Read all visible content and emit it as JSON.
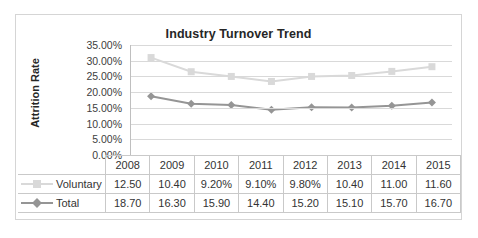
{
  "chart_data": {
    "type": "line",
    "title": "Industry Turnover Trend",
    "xlabel": "",
    "ylabel": "Attrition Rate",
    "ylim": [
      0,
      35
    ],
    "grid": true,
    "legend_position": "data-table",
    "categories": [
      "2008",
      "2009",
      "2010",
      "2011",
      "2012",
      "2013",
      "2014",
      "2015"
    ],
    "ytick_labels": [
      "0.00%",
      "5.00%",
      "10.00%",
      "15.00%",
      "20.00%",
      "25.00%",
      "30.00%",
      "35.00%"
    ],
    "ytick_values": [
      0,
      5,
      10,
      15,
      20,
      25,
      30,
      35
    ],
    "series": [
      {
        "name": "Voluntary",
        "marker": "square",
        "color": "#d9d9d9",
        "table_values": [
          "12.50",
          "10.40",
          "9.20%",
          "9.10%",
          "9.80%",
          "10.40",
          "11.00",
          "11.60"
        ],
        "plotted_values": [
          31.0,
          26.5,
          25.0,
          23.4,
          25.0,
          25.3,
          26.6,
          28.1
        ]
      },
      {
        "name": "Total",
        "marker": "diamond",
        "color": "#959595",
        "table_values": [
          "18.70",
          "16.30",
          "15.90",
          "14.40",
          "15.20",
          "15.10",
          "15.70",
          "16.70"
        ],
        "plotted_values": [
          18.7,
          16.3,
          15.9,
          14.4,
          15.2,
          15.1,
          15.7,
          16.7
        ]
      }
    ]
  },
  "colors": {
    "frame_border": "#d5d5d5",
    "gridline": "#d9d9d9",
    "axis_line": "#bfbfbf",
    "table_border": "#c9c9c9",
    "text": "#333333",
    "title_text": "#262626",
    "series_voluntary": "#d9d9d9",
    "series_total": "#959595"
  }
}
